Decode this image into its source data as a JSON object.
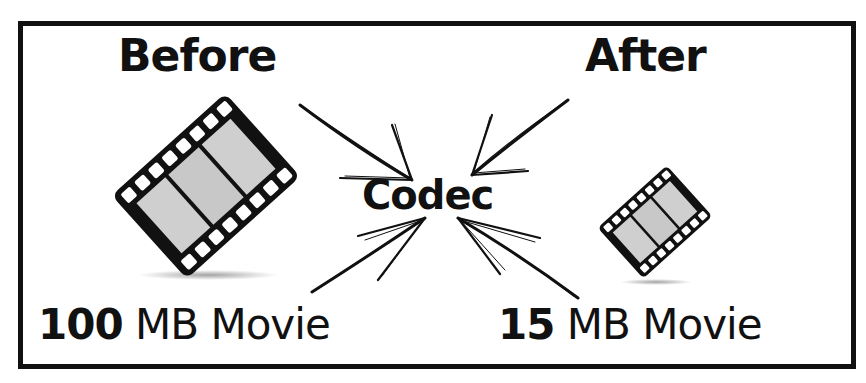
{
  "diagram": {
    "before_label": "Before",
    "after_label": "After",
    "center_label": "Codec",
    "before_size": {
      "number": "100",
      "unit_text": " MB Movie"
    },
    "after_size": {
      "number": "15",
      "unit_text": " MB Movie"
    },
    "icons": {
      "before": "film-strip-icon-large",
      "after": "film-strip-icon-small"
    },
    "colors": {
      "ink": "#111111",
      "frame_fill": "#cfcfcf",
      "background": "#ffffff"
    }
  }
}
